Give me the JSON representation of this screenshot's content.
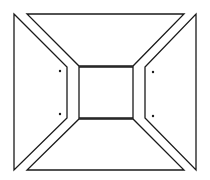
{
  "diagram": {
    "title": "",
    "stroke_color": "#1a1a1a",
    "background": "#ffffff",
    "pieces": [
      {
        "name": "top-trapezoid",
        "points": "27,14 184,14 133,66 79,66"
      },
      {
        "name": "left-trapezoid",
        "points": "14,14 67,67 67,118 14,170"
      },
      {
        "name": "center-square",
        "points": "79,67 133,67 133,118 79,118"
      },
      {
        "name": "right-trapezoid",
        "points": "196,14 196,170 145,118 145,67"
      },
      {
        "name": "bottom-trapezoid",
        "points": "79,119 133,119 184,170 27,170"
      }
    ],
    "dots": [
      {
        "name": "left-upper-dot",
        "cx": 60,
        "cy": 71
      },
      {
        "name": "left-lower-dot",
        "cx": 60,
        "cy": 114
      },
      {
        "name": "right-upper-dot",
        "cx": 153,
        "cy": 72
      },
      {
        "name": "right-lower-dot",
        "cx": 153,
        "cy": 116
      }
    ]
  }
}
